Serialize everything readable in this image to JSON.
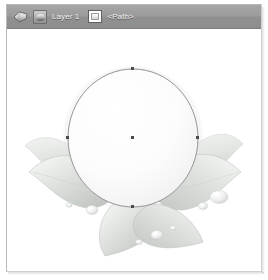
{
  "window": {
    "title": ""
  },
  "statusbar": {
    "node_indicator_icon": "node-arrow-icon",
    "layer_icon": "layer-visibility-icon",
    "layer_label": "Layer 1",
    "path_icon": "path-object-icon",
    "selection_label": "<Path>",
    "background_color": "#989898",
    "text_color": "#f2f2f2"
  },
  "canvas": {
    "background_color": "#ffffff",
    "artwork_name": "lotus-flower-illustration",
    "description": "Grayscale lotus flower with leaves and water droplets",
    "selected_object": "<Path>",
    "selection": {
      "shape": "ellipse",
      "stroke_color": "#9a9a9a",
      "center": {
        "x": 126,
        "y": 108
      },
      "radius_x": 65,
      "radius_y": 69,
      "nodes": [
        {
          "name": "node-top",
          "x": 126,
          "y": 39
        },
        {
          "name": "node-right",
          "x": 191,
          "y": 108
        },
        {
          "name": "node-bottom",
          "x": 126,
          "y": 177
        },
        {
          "name": "node-left",
          "x": 61,
          "y": 108
        },
        {
          "name": "node-center",
          "x": 126,
          "y": 108
        }
      ],
      "node_color": "#4a4a4a"
    },
    "petal_color": "#f7f7f7",
    "leaf_color": "#d9dcd9",
    "droplet_color": "#e8ebe8"
  }
}
